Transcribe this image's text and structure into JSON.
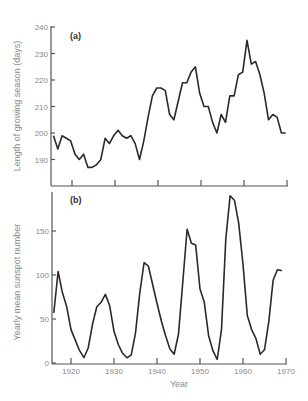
{
  "chart_data": [
    {
      "type": "line",
      "panel": "(a)",
      "title": "",
      "xlabel": "",
      "ylabel": "Length of growing season (days)",
      "ylim": [
        180,
        240
      ],
      "yticks": [
        190,
        200,
        210,
        220,
        230,
        240
      ],
      "xticks": [
        1920,
        1930,
        1940,
        1950,
        1960,
        1970
      ],
      "grid": false,
      "x": [
        1916,
        1917,
        1918,
        1919,
        1920,
        1921,
        1922,
        1923,
        1924,
        1925,
        1926,
        1927,
        1928,
        1929,
        1930,
        1931,
        1932,
        1933,
        1934,
        1935,
        1936,
        1937,
        1938,
        1939,
        1940,
        1941,
        1942,
        1943,
        1944,
        1945,
        1946,
        1947,
        1948,
        1949,
        1950,
        1951,
        1952,
        1953,
        1954,
        1955,
        1956,
        1957,
        1958,
        1959,
        1960,
        1961,
        1962,
        1963,
        1964,
        1965,
        1966,
        1967,
        1968,
        1969,
        1970
      ],
      "series": [
        {
          "name": "Growing season length",
          "values": [
            199,
            194,
            199,
            198,
            197,
            192,
            190,
            192,
            187,
            187,
            188,
            190,
            198,
            196,
            199,
            201,
            199,
            198,
            199,
            196,
            190,
            197,
            206,
            214,
            217,
            217,
            216,
            207,
            205,
            212,
            219,
            219,
            223,
            225,
            215,
            210,
            210,
            204,
            200,
            207,
            204,
            214,
            214,
            222,
            223,
            235,
            226,
            227,
            222,
            215,
            205,
            207,
            206,
            200,
            200
          ]
        }
      ]
    },
    {
      "type": "line",
      "panel": "(b)",
      "title": "",
      "xlabel": "Year",
      "ylabel": "Yearly mean sunspot number",
      "ylim": [
        0,
        190
      ],
      "yticks": [
        0,
        50,
        100,
        150
      ],
      "xticks": [
        1920,
        1930,
        1940,
        1950,
        1960,
        1970
      ],
      "grid": false,
      "x": [
        1916,
        1917,
        1918,
        1919,
        1920,
        1921,
        1922,
        1923,
        1924,
        1925,
        1926,
        1927,
        1928,
        1929,
        1930,
        1931,
        1932,
        1933,
        1934,
        1935,
        1936,
        1937,
        1938,
        1939,
        1940,
        1941,
        1942,
        1943,
        1944,
        1945,
        1946,
        1947,
        1948,
        1949,
        1950,
        1951,
        1952,
        1953,
        1954,
        1955,
        1956,
        1957,
        1958,
        1959,
        1960,
        1961,
        1962,
        1963,
        1964,
        1965,
        1966,
        1967,
        1968,
        1969
      ],
      "series": [
        {
          "name": "Sunspot number",
          "values": [
            57,
            104,
            80,
            64,
            38,
            26,
            14,
            6,
            17,
            44,
            64,
            69,
            78,
            65,
            36,
            21,
            11,
            6,
            9,
            34,
            80,
            114,
            110,
            89,
            68,
            48,
            31,
            16,
            10,
            33,
            92,
            152,
            136,
            134,
            84,
            69,
            31,
            14,
            4,
            38,
            141,
            190,
            185,
            159,
            112,
            54,
            38,
            28,
            10,
            15,
            47,
            94,
            106,
            105
          ]
        }
      ]
    }
  ],
  "labels": {
    "panel_a": "(a)",
    "panel_b": "(b)",
    "ylabel_a": "Length of growing season (days)",
    "ylabel_b": "Yearly mean sunspot number",
    "xlabel": "Year",
    "yticks_a": [
      "190",
      "200",
      "210",
      "220",
      "230",
      "240"
    ],
    "yticks_b": [
      "0",
      "50",
      "100",
      "150"
    ],
    "xticks": [
      "1920",
      "1930",
      "1940",
      "1950",
      "1960",
      "1970"
    ]
  }
}
